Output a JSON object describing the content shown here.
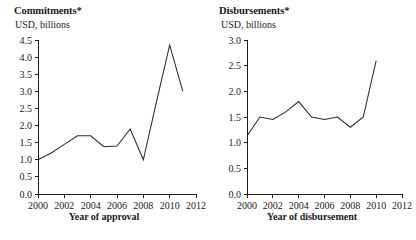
{
  "figure": {
    "panels": [
      {
        "key": "commitments",
        "title": "Commitments*",
        "subtitle": "USD, billions",
        "axis_caption": "Year of approval"
      },
      {
        "key": "disbursements",
        "title": "Disbursements*",
        "subtitle": "USD, billions",
        "axis_caption": "Year of disbursement"
      }
    ]
  },
  "chart_data": [
    {
      "type": "line",
      "title": "Commitments*",
      "subtitle": "USD, billions",
      "xlabel": "Year of approval",
      "ylabel": "USD, billions",
      "xlim": [
        2000,
        2012
      ],
      "ylim": [
        0.0,
        4.5
      ],
      "xticks": [
        2000,
        2002,
        2004,
        2006,
        2008,
        2010,
        2012
      ],
      "xticklabels": [
        "2000",
        "2002",
        "2004",
        "2006",
        "2008",
        "2010",
        "2012"
      ],
      "yticks": [
        0.0,
        0.5,
        1.0,
        1.5,
        2.0,
        2.5,
        3.0,
        3.5,
        4.0,
        4.5
      ],
      "yticklabels": [
        "0.0",
        "0.5",
        "1.0",
        "1.5",
        "2.0",
        "2.5",
        "3.0",
        "3.5",
        "4.0",
        "4.5"
      ],
      "grid": false,
      "legend": false,
      "x": [
        2000,
        2001,
        2002,
        2003,
        2004,
        2005,
        2006,
        2007,
        2008,
        2009,
        2010,
        2011
      ],
      "values": [
        1.0,
        1.2,
        1.45,
        1.7,
        1.7,
        1.38,
        1.4,
        1.9,
        1.0,
        2.7,
        4.35,
        3.0
      ],
      "series": [
        {
          "name": "Commitments",
          "values": [
            1.0,
            1.2,
            1.45,
            1.7,
            1.7,
            1.38,
            1.4,
            1.9,
            1.0,
            2.7,
            4.35,
            3.0
          ]
        }
      ]
    },
    {
      "type": "line",
      "title": "Disbursements*",
      "subtitle": "USD, billions",
      "xlabel": "Year of disbursement",
      "ylabel": "USD, billions",
      "xlim": [
        2000,
        2012
      ],
      "ylim": [
        0.0,
        3.0
      ],
      "xticks": [
        2000,
        2002,
        2004,
        2006,
        2008,
        2010,
        2012
      ],
      "xticklabels": [
        "2000",
        "2002",
        "2004",
        "2006",
        "2008",
        "2010",
        "2012"
      ],
      "yticks": [
        0.0,
        0.5,
        1.0,
        1.5,
        2.0,
        2.5,
        3.0
      ],
      "yticklabels": [
        "0.0",
        "0.5",
        "1.0",
        "1.5",
        "2.0",
        "2.5",
        "3.0"
      ],
      "grid": false,
      "legend": false,
      "x": [
        2000,
        2001,
        2002,
        2003,
        2004,
        2005,
        2006,
        2007,
        2008,
        2009,
        2010
      ],
      "values": [
        1.13,
        1.5,
        1.45,
        1.6,
        1.8,
        1.5,
        1.45,
        1.5,
        1.3,
        1.5,
        2.6
      ],
      "series": [
        {
          "name": "Disbursements",
          "values": [
            1.13,
            1.5,
            1.45,
            1.6,
            1.8,
            1.5,
            1.45,
            1.5,
            1.3,
            1.5,
            2.6
          ]
        }
      ]
    }
  ]
}
